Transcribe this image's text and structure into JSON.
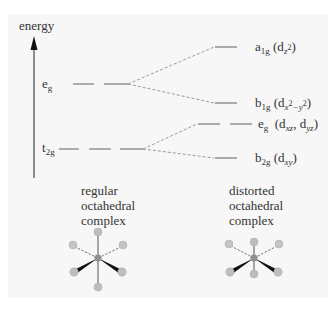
{
  "axis": {
    "label": "energy"
  },
  "left_levels": {
    "eg": {
      "label_main": "e",
      "label_sub": "g"
    },
    "t2g": {
      "label_main": "t",
      "label_sub": "2g"
    }
  },
  "right_levels": {
    "a1g": {
      "sym": "a",
      "sym_sub": "1g",
      "orb_pre": "(d",
      "orb_sub": "z",
      "orb_sup": "2",
      "orb_post": ")"
    },
    "b1g": {
      "sym": "b",
      "sym_sub": "1g",
      "orb_pre": "(d",
      "orb_sub": "x",
      "orb_sup1": "2",
      "orb_mid": "−y",
      "orb_sup2": "2",
      "orb_post": ")"
    },
    "eg": {
      "sym": "e",
      "sym_sub": "g",
      "orb_pre": "(d",
      "orb_sub1": "xz",
      "orb_mid": ", d",
      "orb_sub2": "yz",
      "orb_post": ")"
    },
    "b2g": {
      "sym": "b",
      "sym_sub": "2g",
      "orb_pre": "(d",
      "orb_sub": "xy",
      "orb_post": ")"
    }
  },
  "captions": {
    "left": "regular\noctahedral\ncomplex",
    "right": "distorted\noctahedral\ncomplex"
  },
  "colors": {
    "level_line": "#8a8a8a",
    "dash_line": "#8a8a8a",
    "atom": "#bdbdbd",
    "center_atom": "#8f8f8f",
    "bold_bond": "#111111"
  }
}
